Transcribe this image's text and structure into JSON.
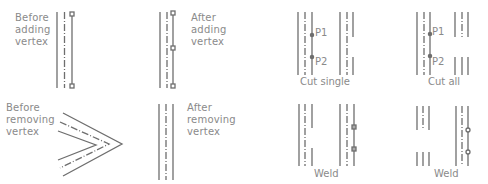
{
  "panels": {
    "before_adding": {
      "label": "Before\nadding\nvertex"
    },
    "after_adding": {
      "label": "After\nadding\nvertex"
    },
    "before_removing": {
      "label": "Before\nremoving\nvertex"
    },
    "after_removing": {
      "label": "After\nremoving\nvertex"
    },
    "cut_single": {
      "caption": "Cut single",
      "p1": "P1",
      "p2": "P2"
    },
    "cut_all": {
      "caption": "Cut all",
      "p1": "P1",
      "p2": "P2"
    },
    "weld_single": {
      "caption": "Weld"
    },
    "weld_all": {
      "caption": "Weld"
    }
  },
  "colors": {
    "line": "#6e6e6e",
    "text": "#8a8a8a",
    "background": "#ffffff"
  }
}
